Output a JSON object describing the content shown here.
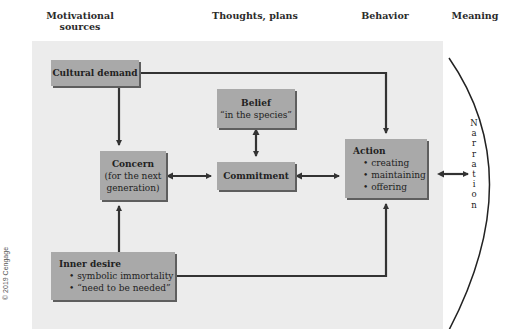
{
  "column_headers": {
    "motivational_sources": "Motivational sources",
    "thoughts_plans": "Thoughts, plans",
    "behavior": "Behavior",
    "meaning": "Meaning"
  },
  "boxes": {
    "cultural_demand": {
      "title": "Cultural demand"
    },
    "belief": {
      "title": "Belief",
      "subtitle": "“in the species”"
    },
    "concern": {
      "title": "Concern",
      "line2": "(for the next",
      "line3": "generation)"
    },
    "commitment": {
      "title": "Commitment"
    },
    "action": {
      "title": "Action",
      "items": [
        "• creating",
        "• maintaining",
        "• offering"
      ]
    },
    "inner_desire": {
      "title": "Inner desire",
      "items": [
        "• symbolic immortality",
        "• “need to be needed”"
      ]
    }
  },
  "narration": {
    "letters": [
      "N",
      "a",
      "r",
      "r",
      "a",
      "t",
      "i",
      "o",
      "n"
    ]
  },
  "copyright": "© 2019 Cengage",
  "colors": {
    "panel": "#ececec",
    "box": "#a9a9a9",
    "box_shadow": "#5e5e5e",
    "line": "#333333"
  }
}
